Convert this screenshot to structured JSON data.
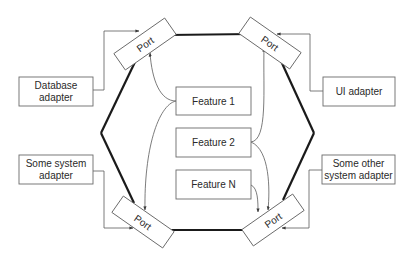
{
  "diagram": {
    "colors": {
      "background": "#ffffff",
      "hexagon_stroke": "#1a1a1a",
      "box_stroke": "#6a6a6a",
      "text": "#2a2a2a"
    },
    "ports": [
      {
        "id": "port-top-left",
        "label": "Port"
      },
      {
        "id": "port-top-right",
        "label": "Port"
      },
      {
        "id": "port-bottom-left",
        "label": "Port"
      },
      {
        "id": "port-bottom-right",
        "label": "Port"
      }
    ],
    "adapters": [
      {
        "id": "database-adapter",
        "lines": [
          "Database",
          "adapter"
        ]
      },
      {
        "id": "ui-adapter",
        "lines": [
          "UI adapter"
        ]
      },
      {
        "id": "some-system-adapter",
        "lines": [
          "Some system",
          "adapter"
        ]
      },
      {
        "id": "some-other-system-adapter",
        "lines": [
          "Some other",
          "system adapter"
        ]
      }
    ],
    "features": [
      {
        "id": "feature-1",
        "label": "Feature 1"
      },
      {
        "id": "feature-2",
        "label": "Feature 2"
      },
      {
        "id": "feature-n",
        "label": "Feature N"
      }
    ],
    "edges": [
      {
        "from": "database-adapter",
        "to": "port-top-left"
      },
      {
        "from": "ui-adapter",
        "to": "port-top-right"
      },
      {
        "from": "some-system-adapter",
        "to": "port-bottom-left"
      },
      {
        "from": "some-other-system-adapter",
        "to": "port-bottom-right"
      },
      {
        "from": "feature-1",
        "to": "port-top-left"
      },
      {
        "from": "feature-1",
        "to": "port-bottom-left"
      },
      {
        "from": "feature-2",
        "to": "port-top-right"
      },
      {
        "from": "feature-2",
        "to": "port-bottom-right"
      },
      {
        "from": "feature-n",
        "to": "port-bottom-right"
      }
    ]
  }
}
